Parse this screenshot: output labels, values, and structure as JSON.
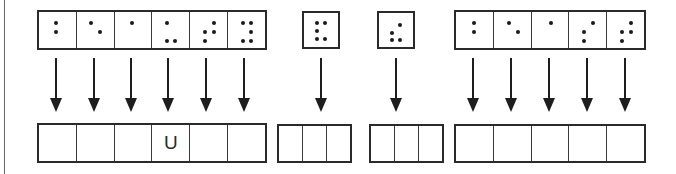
{
  "diagram": {
    "top_groups": [
      {
        "cells": [
          {
            "dots": [
              1,
              2
            ]
          },
          {
            "dots": [
              1,
              5
            ]
          },
          {
            "dots": [
              1
            ]
          },
          {
            "dots": [
              1,
              3,
              6
            ]
          },
          {
            "dots": [
              2,
              3,
              4,
              5
            ]
          },
          {
            "dots": [
              1,
              3,
              4,
              5,
              6
            ]
          }
        ]
      },
      {
        "cells": [
          {
            "dots": [
              1,
              2,
              3,
              4,
              6
            ]
          }
        ]
      },
      {
        "cells": [
          {
            "dots": [
              2,
              3,
              4,
              6
            ]
          }
        ]
      },
      {
        "cells": [
          {
            "dots": [
              1,
              2
            ]
          },
          {
            "dots": [
              1,
              5
            ]
          },
          {
            "dots": [
              1
            ]
          },
          {
            "dots": [
              3,
              4,
              2
            ]
          },
          {
            "dots": [
              2,
              3,
              4,
              5
            ]
          }
        ]
      }
    ],
    "bottom_groups": [
      {
        "cells": [
          "",
          "",
          "",
          "U",
          "",
          ""
        ]
      },
      {
        "cells": [
          "",
          "",
          ""
        ]
      },
      {
        "cells": [
          "",
          "",
          ""
        ]
      },
      {
        "cells": [
          "",
          "",
          "",
          "",
          ""
        ]
      }
    ],
    "colors": {
      "line": "#2a2a2a",
      "dot": "#1a1a1a",
      "background": "#ffffff"
    }
  }
}
